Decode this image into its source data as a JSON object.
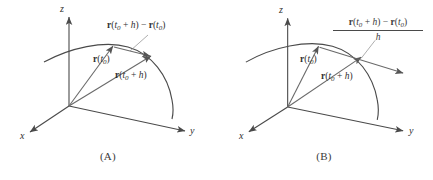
{
  "figure": {
    "type": "math-diagram",
    "stroke_color": "#4a4a4a",
    "background_color": "#ffffff"
  },
  "panels": [
    {
      "id": "A",
      "caption": "(A)",
      "axes": {
        "x": "x",
        "y": "y",
        "z": "z"
      },
      "labels": {
        "position_vector": {
          "vec": "r",
          "arg": "t",
          "sub": "0",
          "full": "r(t0)"
        },
        "secondary_vector": {
          "vec": "r",
          "arg": "t",
          "sub": "0",
          "plus": "+ h",
          "full": "r(t0 + h)"
        },
        "difference_vector": {
          "full": "r(t0 + h) - r(t0)"
        }
      }
    },
    {
      "id": "B",
      "caption": "(B)",
      "axes": {
        "x": "x",
        "y": "y",
        "z": "z"
      },
      "labels": {
        "position_vector": {
          "vec": "r",
          "arg": "t",
          "sub": "0",
          "full": "r(t0)"
        },
        "secondary_vector": {
          "vec": "r",
          "arg": "t",
          "sub": "0",
          "plus": "+ h",
          "full": "r(t0 + h)"
        },
        "difference_quotient": {
          "numerator": "r(t0 + h) - r(t0)",
          "denominator": "h",
          "full": "[r(t0 + h) - r(t0)] / h"
        }
      }
    }
  ],
  "symbols": {
    "vector_r": "r",
    "t": "t",
    "zero": "0",
    "plus_h": "+ h",
    "minus": "−",
    "h": "h",
    "open_paren": "(",
    "close_paren": ")"
  }
}
